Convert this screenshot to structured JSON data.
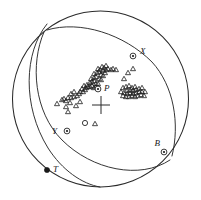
{
  "figure": {
    "type": "stereographic-projection",
    "background_color": "#ffffff",
    "line_color": "#2a2a2a",
    "marker_color": "#1a1a1a"
  },
  "primitive_circle": {
    "name": "primitive-circle",
    "cx": 100.5,
    "cy": 99.0,
    "r": 88.0
  },
  "nodal_planes": [
    {
      "name": "nodal-plane-1",
      "path": "M 47 24 C 24 52, 22 106, 48 148 C 62 170, 82 184, 100 187"
    },
    {
      "name": "nodal-plane-2",
      "path": "M 44 32 C 30 64, 34 112, 62 140 C 92 170, 140 180, 170 160"
    },
    {
      "name": "nodal-plane-3",
      "path": "M 47 30 C 80 20, 124 34, 152 62 C 174 86, 180 124, 172 156"
    }
  ],
  "center_cross": {
    "name": "center-cross",
    "cx": 101,
    "cy": 105,
    "size": 9
  },
  "axes": [
    {
      "id": "X",
      "label": "X",
      "marker": "circled-dot",
      "x": 133,
      "y": 56,
      "label_dx": 7,
      "label_dy": -2
    },
    {
      "id": "P",
      "label": "P",
      "marker": "circled-dot",
      "x": 98,
      "y": 89,
      "label_dx": 6,
      "label_dy": 2
    },
    {
      "id": "Y",
      "label": "Y",
      "marker": "circled-dot",
      "x": 67,
      "y": 131,
      "label_dx": -10,
      "label_dy": 3
    },
    {
      "id": "B",
      "label": "B",
      "marker": "circled-dot",
      "x": 164,
      "y": 152,
      "label_dx": -4,
      "label_dy": -6
    },
    {
      "id": "T",
      "label": "T",
      "marker": "filled-dot",
      "x": 47,
      "y": 170,
      "label_dx": 6,
      "label_dy": 2
    }
  ],
  "open_circles": [
    {
      "name": "open-circle-datum",
      "x": 85,
      "y": 123,
      "r": 2.6
    }
  ],
  "triangles": {
    "name": "first-motion-triangles",
    "size": 5.0,
    "points": [
      [
        57,
        104
      ],
      [
        66,
        107
      ],
      [
        68,
        112
      ],
      [
        70,
        103
      ],
      [
        76,
        106
      ],
      [
        80,
        102
      ],
      [
        71,
        98
      ],
      [
        74,
        97
      ],
      [
        77,
        96
      ],
      [
        79,
        94
      ],
      [
        71,
        94
      ],
      [
        74,
        92
      ],
      [
        68,
        98
      ],
      [
        66,
        101
      ],
      [
        64,
        99
      ],
      [
        62,
        100
      ],
      [
        80,
        92
      ],
      [
        83,
        92
      ],
      [
        85,
        90
      ],
      [
        82,
        89
      ],
      [
        86,
        88
      ],
      [
        88,
        87
      ],
      [
        84,
        86
      ],
      [
        87,
        85
      ],
      [
        90,
        87
      ],
      [
        92,
        86
      ],
      [
        94,
        88
      ],
      [
        96,
        87
      ],
      [
        90,
        83
      ],
      [
        92,
        82
      ],
      [
        94,
        81
      ],
      [
        96,
        84
      ],
      [
        98,
        84
      ],
      [
        91,
        79
      ],
      [
        94,
        78
      ],
      [
        96,
        77
      ],
      [
        99,
        79
      ],
      [
        101,
        80
      ],
      [
        94,
        74
      ],
      [
        97,
        73
      ],
      [
        99,
        72
      ],
      [
        101,
        75
      ],
      [
        103,
        76
      ],
      [
        98,
        69
      ],
      [
        100,
        70
      ],
      [
        103,
        71
      ],
      [
        105,
        73
      ],
      [
        102,
        67
      ],
      [
        104,
        68
      ],
      [
        106,
        70
      ],
      [
        106,
        66
      ],
      [
        108,
        69
      ],
      [
        111,
        70
      ],
      [
        113,
        69
      ],
      [
        116,
        70
      ],
      [
        95,
        124
      ],
      [
        124,
        79
      ],
      [
        128,
        73
      ],
      [
        133,
        69
      ],
      [
        123,
        88
      ],
      [
        126,
        87
      ],
      [
        129,
        86
      ],
      [
        132,
        88
      ],
      [
        135,
        87
      ],
      [
        127,
        91
      ],
      [
        130,
        90
      ],
      [
        133,
        91
      ],
      [
        136,
        90
      ],
      [
        139,
        89
      ],
      [
        124,
        93
      ],
      [
        127,
        94
      ],
      [
        130,
        93
      ],
      [
        133,
        94
      ],
      [
        136,
        93
      ],
      [
        139,
        92
      ],
      [
        142,
        92
      ],
      [
        126,
        97
      ],
      [
        129,
        97
      ],
      [
        132,
        96
      ],
      [
        135,
        97
      ],
      [
        138,
        96
      ],
      [
        141,
        95
      ],
      [
        144,
        96
      ],
      [
        123,
        96
      ],
      [
        121,
        92
      ],
      [
        145,
        92
      ],
      [
        142,
        88
      ]
    ]
  }
}
